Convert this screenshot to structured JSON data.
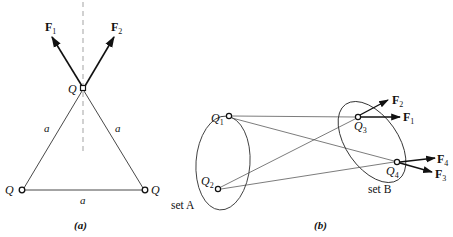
{
  "figure_a": {
    "caption": "(a)",
    "charges": [
      {
        "name": "Q",
        "role": "apex"
      },
      {
        "name": "Q",
        "role": "bottom-left"
      },
      {
        "name": "Q",
        "role": "bottom-right"
      }
    ],
    "side_labels": [
      "a",
      "a",
      "a"
    ],
    "forces": [
      {
        "symbol": "F",
        "sub": "1"
      },
      {
        "symbol": "F",
        "sub": "2"
      }
    ]
  },
  "figure_b": {
    "caption": "(b)",
    "set_a_label": "set A",
    "set_b_label": "set B",
    "charges": [
      {
        "symbol": "Q",
        "sub": "1"
      },
      {
        "symbol": "Q",
        "sub": "2"
      },
      {
        "symbol": "Q",
        "sub": "3"
      },
      {
        "symbol": "Q",
        "sub": "4"
      }
    ],
    "forces": [
      {
        "symbol": "F",
        "sub": "2"
      },
      {
        "symbol": "F",
        "sub": "1"
      },
      {
        "symbol": "F",
        "sub": "4"
      },
      {
        "symbol": "F",
        "sub": "3"
      }
    ]
  }
}
